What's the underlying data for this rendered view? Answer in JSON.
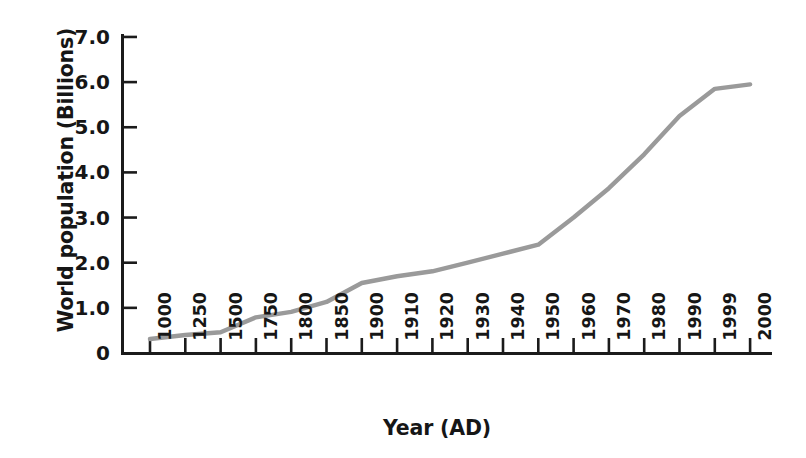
{
  "chart_data": {
    "type": "line",
    "title": "",
    "xlabel": "Year (AD)",
    "ylabel": "World population (Billions)",
    "categories": [
      "1000",
      "1250",
      "1500",
      "1750",
      "1800",
      "1850",
      "1900",
      "1910",
      "1920",
      "1930",
      "1940",
      "1950",
      "1960",
      "1970",
      "1980",
      "1990",
      "1999",
      "2000"
    ],
    "values": [
      0.31,
      0.4,
      0.46,
      0.79,
      0.91,
      1.13,
      1.55,
      1.7,
      1.81,
      2.0,
      2.2,
      2.4,
      3.0,
      3.65,
      4.4,
      5.25,
      5.85,
      5.95
    ],
    "ytick_labels": [
      "7.0",
      "6.0",
      "5.0",
      "4.0",
      "3.0",
      "2.0",
      "1.0",
      "0"
    ],
    "ytick_values": [
      7.0,
      6.0,
      5.0,
      4.0,
      3.0,
      2.0,
      1.0,
      0
    ],
    "ylim": [
      0,
      7.0
    ],
    "grid": false,
    "legend": null,
    "series_color": "#9a9a9a",
    "axis_color": "#1b1b1b"
  },
  "axes": {
    "y_title": "World population (Billions)",
    "x_title": "Year (AD)"
  }
}
